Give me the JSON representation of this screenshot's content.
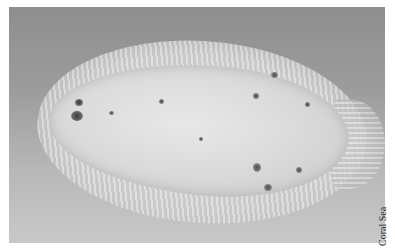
{
  "photo": {
    "subject": "flatfish specimen on grey background",
    "background_color_top": "#8e8e8e",
    "background_color_bottom": "#c8c8c8"
  },
  "caption": {
    "text": "Coral Sea"
  }
}
